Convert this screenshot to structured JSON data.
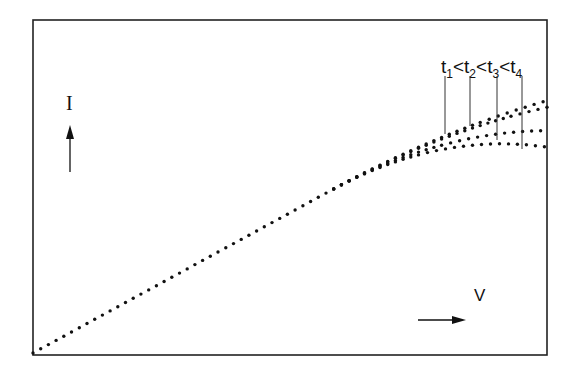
{
  "chart_data": {
    "type": "line",
    "title": "",
    "xlabel": "V",
    "ylabel": "I",
    "grid": false,
    "legend": "t1 < t2 < t3 < t4",
    "annotation": "t1<t2<t3<t4",
    "x_range": [
      0,
      1
    ],
    "y_range": [
      0,
      1
    ],
    "linestyle": "dotted",
    "series": [
      {
        "name": "t1",
        "x": [
          0,
          0.58,
          0.8,
          1.0
        ],
        "y": [
          0,
          0.49,
          0.67,
          0.76
        ]
      },
      {
        "name": "t2",
        "x": [
          0,
          0.58,
          0.8,
          1.0
        ],
        "y": [
          0,
          0.49,
          0.65,
          0.74
        ]
      },
      {
        "name": "t3",
        "x": [
          0,
          0.58,
          0.8,
          1.0
        ],
        "y": [
          0,
          0.49,
          0.61,
          0.67
        ]
      },
      {
        "name": "t4",
        "x": [
          0,
          0.58,
          0.8,
          1.0
        ],
        "y": [
          0,
          0.49,
          0.58,
          0.62
        ]
      }
    ]
  },
  "labels": {
    "y_axis": "I",
    "x_axis": "V",
    "t": "t",
    "lt": "<",
    "sub1": "1",
    "sub2": "2",
    "sub3": "3",
    "sub4": "4"
  }
}
